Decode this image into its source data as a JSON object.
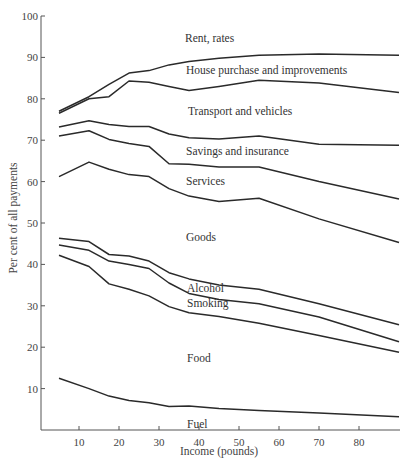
{
  "chart_data": {
    "type": "line",
    "title": "",
    "xlabel": "Income (pounds)",
    "ylabel": "Per cent of all payments",
    "xlim": [
      0,
      90
    ],
    "ylim": [
      0,
      100
    ],
    "xticks": [
      10,
      20,
      30,
      40,
      50,
      60,
      70,
      80
    ],
    "yticks": [
      10,
      20,
      30,
      40,
      50,
      60,
      70,
      80,
      90,
      100
    ],
    "grid": false,
    "legend": "inline labels between curves",
    "x": [
      5,
      12.5,
      17.5,
      22.5,
      27.5,
      32.5,
      37.5,
      45,
      55,
      70,
      90
    ],
    "series": [
      {
        "name": "Rent, rates (upper boundary)",
        "values": [
          77,
          80.5,
          83.5,
          86.2,
          86.8,
          88.2,
          89,
          89.8,
          90.5,
          90.8,
          90.5
        ]
      },
      {
        "name": "House purchase and improvements (upper boundary)",
        "values": [
          76.5,
          80,
          80.5,
          84.3,
          84,
          83,
          82,
          83,
          84.5,
          83.8,
          81.5
        ]
      },
      {
        "name": "Transport and vehicles (upper boundary)",
        "values": [
          73.2,
          74.7,
          73.8,
          73.3,
          73.3,
          71.5,
          70.6,
          70.3,
          71,
          69,
          68.8
        ]
      },
      {
        "name": "Savings and insurance (upper boundary)",
        "values": [
          71,
          72.3,
          70.2,
          69.2,
          68.5,
          64.3,
          64.2,
          63.5,
          63.5,
          60,
          55.8
        ]
      },
      {
        "name": "Services (upper boundary)",
        "values": [
          61.2,
          64.7,
          63,
          61.7,
          61.2,
          58.3,
          56.5,
          55.2,
          56,
          51,
          45.3
        ]
      },
      {
        "name": "Goods (upper boundary)",
        "values": [
          46.3,
          45.5,
          42.4,
          42,
          40.8,
          38,
          36.5,
          35,
          34,
          30.5,
          25.4
        ]
      },
      {
        "name": "Alcohol (upper boundary)",
        "values": [
          44.7,
          43.4,
          40.8,
          40,
          39,
          35.5,
          33,
          31.5,
          30.5,
          27.3,
          21.3
        ]
      },
      {
        "name": "Smoking (upper boundary)",
        "values": [
          42.2,
          39.5,
          35.3,
          34,
          32.4,
          29.8,
          28.3,
          27.4,
          25.8,
          22.8,
          18.8
        ]
      },
      {
        "name": "Fuel (upper boundary of Food)",
        "values": [
          12.5,
          10,
          8.2,
          7.1,
          6.6,
          5.7,
          5.8,
          5.2,
          4.7,
          4.1,
          3.2
        ]
      }
    ],
    "annotations": [
      "Rent, rates",
      "House purchase and improvements",
      "Transport and vehicles",
      "Savings and insurance",
      "Services",
      "Goods",
      "Alcohol",
      "Smoking",
      "Food",
      "Fuel"
    ]
  },
  "labels": {
    "rent": "Rent, rates",
    "house": "House purchase and improvements",
    "transport": "Transport and vehicles",
    "savings": "Savings and insurance",
    "services": "Services",
    "goods": "Goods",
    "alcohol": "Alcohol",
    "smoking": "Smoking",
    "food": "Food",
    "fuel": "Fuel"
  },
  "axes": {
    "xlabel": "Income (pounds)",
    "ylabel": "Per cent of all payments"
  }
}
